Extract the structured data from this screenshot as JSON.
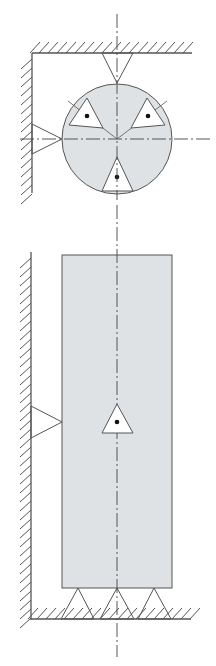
{
  "diagram": {
    "title": "",
    "colors": {
      "background": "#ffffff",
      "part_fill": "#dfe2e4",
      "line": "#555555",
      "centerline": "#444444",
      "hatch": "#555555",
      "dot": "#111111"
    },
    "upper_view": {
      "name": "disk",
      "circle": {
        "cx": 117,
        "cy": 139,
        "r": 55
      },
      "walls": [
        {
          "name": "top-wall",
          "x1": 32,
          "y1": 53,
          "x2": 192,
          "y2": 53
        },
        {
          "name": "left-wall",
          "x1": 32,
          "y1": 53,
          "x2": 32,
          "y2": 193
        }
      ],
      "external_locators": [
        {
          "name": "top-locator",
          "points": "102,53 133,53 117,83"
        },
        {
          "name": "left-locator",
          "points": "32,124 32,154 62,139"
        }
      ],
      "internal_markers": [
        {
          "name": "upper-left-marker",
          "points": "69,125 87,98 103,128",
          "dot": [
            87,
            116
          ]
        },
        {
          "name": "upper-right-marker",
          "points": "131,128 147,98 165,125",
          "dot": [
            148,
            116
          ]
        },
        {
          "name": "bottom-marker",
          "points": "102,191 117,157 133,191",
          "dot": [
            117,
            177
          ]
        }
      ],
      "centerlines": [
        {
          "name": "vertical-centerline",
          "x1": 117,
          "y1": 14,
          "x2": 117,
          "y2": 200
        },
        {
          "name": "horizontal-centerline",
          "x1": 20,
          "y1": 139,
          "x2": 212,
          "y2": 139
        }
      ]
    },
    "lower_view": {
      "name": "block",
      "rect": {
        "x": 62,
        "y": 255,
        "w": 110,
        "h": 333
      },
      "walls": [
        {
          "name": "left-wall",
          "x1": 31,
          "y1": 252,
          "x2": 31,
          "y2": 619
        },
        {
          "name": "floor",
          "x1": 30,
          "y1": 619,
          "x2": 191,
          "y2": 619
        }
      ],
      "external_locators": [
        {
          "name": "left-locator",
          "points": "31,406 31,438 62,422"
        },
        {
          "name": "bottom-locator-left",
          "points": "61,619 94,619 78,588"
        },
        {
          "name": "bottom-locator-center",
          "points": "100,619 134,619 117,588"
        },
        {
          "name": "bottom-locator-right",
          "points": "138,619 171,619 154,588"
        }
      ],
      "internal_markers": [
        {
          "name": "center-marker",
          "points": "102,433 117,404 133,433",
          "dot": [
            117,
            422
          ]
        }
      ],
      "centerlines": [
        {
          "name": "vertical-centerline",
          "x1": 117,
          "y1": 205,
          "x2": 117,
          "y2": 657
        }
      ]
    }
  }
}
